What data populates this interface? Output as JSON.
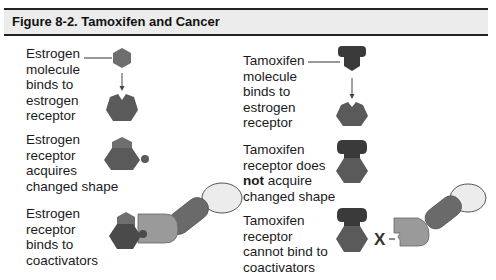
{
  "figure": {
    "title": "Figure 8-2. Tamoxifen and Cancer"
  },
  "left_column": {
    "rows": [
      {
        "lines": [
          "Estrogen",
          "molecule",
          "binds to",
          "estrogen",
          "receptor"
        ]
      },
      {
        "lines": [
          "Estrogen",
          "receptor",
          "acquires",
          "changed shape"
        ]
      },
      {
        "lines": [
          "Estrogen",
          "receptor",
          "binds to",
          "coactivators"
        ]
      }
    ]
  },
  "right_column": {
    "rows": [
      {
        "lines": [
          "Tamoxifen",
          "molecule",
          "binds to",
          "estrogen",
          "receptor"
        ]
      },
      {
        "lines": [
          "Tamoxifen",
          "receptor does",
          "acquire",
          "changed shape"
        ],
        "emphasis": "not"
      },
      {
        "lines": [
          "Tamoxifen",
          "receptor",
          "cannot bind to",
          "coactivators"
        ]
      }
    ]
  },
  "block_symbol": "X",
  "colors": {
    "header_bg": "#ececec",
    "rule": "#222222",
    "estrogen": "#6e6e6e",
    "receptor": "#5a5a5a",
    "tamoxifen": "#3a3a3a",
    "coactivator_1": "#9a9a9a",
    "coactivator_2": "#6a6a6a",
    "coactivator_3": "#ececec"
  }
}
